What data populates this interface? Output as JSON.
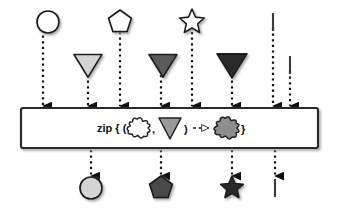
{
  "diagram": {
    "type": "marble-diagram",
    "colors": {
      "line": "#3b3b3b",
      "white": "#ffffff",
      "light_gray": "#d4d4d4",
      "mid_gray": "#9a9a9a",
      "dark_gray": "#5a5a5a",
      "darker_gray": "#4a4a4a",
      "near_black": "#2b2b2b",
      "outline": "#1a1a1a",
      "box_fill": "#ffffff",
      "box_border": "#2b2b2b",
      "shadow": "#b9b9b9"
    },
    "lines": [
      {
        "id": "input-stream-1",
        "name": "top-input-timeline",
        "y": 22,
        "x_start": 18,
        "x_end": 320,
        "arrow": true,
        "events": [
          {
            "name": "event-circle-white",
            "shape": "circle",
            "x": 48,
            "fill": "#ffffff",
            "size": 11
          },
          {
            "name": "event-pentagon-white",
            "shape": "pentagon",
            "x": 120,
            "fill": "#ffffff",
            "size": 11
          },
          {
            "name": "event-star-white",
            "shape": "star",
            "x": 192,
            "fill": "#ffffff",
            "size": 11
          },
          {
            "name": "event-complete-tick",
            "shape": "tick",
            "x": 273,
            "fill": "#3b3b3b",
            "size": 9
          }
        ]
      },
      {
        "id": "input-stream-2",
        "name": "second-input-timeline",
        "y": 65,
        "x_start": 18,
        "x_end": 320,
        "arrow": true,
        "events": [
          {
            "name": "event-triangle-light",
            "shape": "triangle-down",
            "x": 88,
            "fill": "#d4d4d4",
            "size": 12
          },
          {
            "name": "event-triangle-mid",
            "shape": "triangle-down",
            "x": 163,
            "fill": "#5a5a5a",
            "size": 12
          },
          {
            "name": "event-triangle-dark",
            "shape": "triangle-down",
            "x": 232,
            "fill": "#2b2b2b",
            "size": 13
          },
          {
            "name": "event-complete-tick",
            "shape": "tick",
            "x": 290,
            "fill": "#3b3b3b",
            "size": 9
          }
        ]
      },
      {
        "id": "output-stream",
        "name": "output-timeline",
        "y": 188,
        "x_start": 18,
        "x_end": 320,
        "arrow": true,
        "events": [
          {
            "name": "event-circle-lightgray",
            "shape": "circle",
            "x": 91,
            "fill": "#d4d4d4",
            "size": 11
          },
          {
            "name": "event-pentagon-dark",
            "shape": "pentagon",
            "x": 161,
            "fill": "#4a4a4a",
            "size": 11
          },
          {
            "name": "event-star-dark",
            "shape": "star",
            "x": 232,
            "fill": "#2b2b2b",
            "size": 10
          },
          {
            "name": "event-complete-tick",
            "shape": "tick",
            "x": 275,
            "fill": "#3b3b3b",
            "size": 9
          }
        ]
      }
    ],
    "dashed_inputs": [
      {
        "name": "dashed-arrow-into-box",
        "x": 43,
        "y1": 30,
        "y2": 106
      },
      {
        "name": "dashed-arrow-into-box",
        "x": 88,
        "y1": 75,
        "y2": 106
      },
      {
        "name": "dashed-arrow-into-box",
        "x": 120,
        "y1": 32,
        "y2": 106
      },
      {
        "name": "dashed-arrow-into-box",
        "x": 161,
        "y1": 75,
        "y2": 106
      },
      {
        "name": "dashed-arrow-into-box",
        "x": 192,
        "y1": 32,
        "y2": 106
      },
      {
        "name": "dashed-arrow-into-box",
        "x": 232,
        "y1": 75,
        "y2": 106
      },
      {
        "name": "dashed-arrow-into-box",
        "x": 273,
        "y1": 28,
        "y2": 106
      },
      {
        "name": "dashed-arrow-into-box",
        "x": 290,
        "y1": 71,
        "y2": 106
      }
    ],
    "dashed_outputs": [
      {
        "name": "dashed-arrow-out-of-box",
        "x": 91,
        "y1": 150,
        "y2": 176
      },
      {
        "name": "dashed-arrow-out-of-box",
        "x": 161,
        "y1": 150,
        "y2": 176
      },
      {
        "name": "dashed-arrow-out-of-box",
        "x": 232,
        "y1": 150,
        "y2": 176
      },
      {
        "name": "dashed-arrow-out-of-box",
        "x": 275,
        "y1": 150,
        "y2": 176
      }
    ],
    "operator_box": {
      "name": "zip-operator-box",
      "x": 21,
      "y": 108,
      "width": 297,
      "height": 40,
      "label_prefix": "zip { (",
      "label_comma": ",",
      "label_close_paren": ")",
      "label_close_brace": "}",
      "arrow_glyph": "- -▷",
      "operand_1": {
        "name": "cloud-white-glyph",
        "shape": "cloud",
        "fill": "#ffffff"
      },
      "operand_2": {
        "name": "triangle-gray-glyph",
        "shape": "triangle-down",
        "fill": "#9a9a9a"
      },
      "result": {
        "name": "cloud-gray-glyph",
        "shape": "cloud",
        "fill": "#8d8d8d"
      }
    }
  }
}
